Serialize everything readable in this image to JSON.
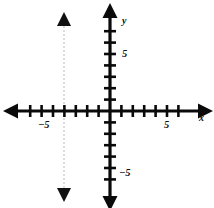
{
  "figure": {
    "kind": "coordinate-plane",
    "width": 214,
    "height": 208,
    "background_color": "#ffffff"
  },
  "axes": {
    "x": {
      "label": "x",
      "color": "#0a0a0a",
      "origin_px": 110,
      "axis_y_px": 111,
      "unit_px": 11.4,
      "line_start_px": 18,
      "line_end_px": 198,
      "tick_half_length_px": 6,
      "tick_values": [
        -7,
        -6,
        -5,
        -4,
        -3,
        -2,
        -1,
        1,
        2,
        3,
        4,
        5,
        6
      ],
      "labeled_ticks": [
        {
          "value": -5,
          "text": "−5"
        },
        {
          "value": 5,
          "text": "5"
        }
      ]
    },
    "y": {
      "label": "y",
      "color": "#0a0a0a",
      "origin_px": 111,
      "axis_x_px": 110,
      "unit_px": 11.4,
      "line_start_px": 18,
      "line_end_px": 196,
      "tick_half_length_px": 6,
      "tick_values": [
        -7,
        -6,
        -5,
        -4,
        -3,
        -2,
        -1,
        1,
        2,
        3,
        4,
        5,
        6,
        7
      ],
      "labeled_ticks": [
        {
          "value": 5,
          "text": "5"
        },
        {
          "value": -5,
          "text": "−5"
        }
      ]
    }
  },
  "graph": {
    "type": "vertical-line",
    "equation_value": -4,
    "x_px": 64,
    "stroke_color": "#b9b9b9",
    "stroke_width": 1,
    "dash_pattern": "2 2",
    "top_px": 26,
    "bottom_px": 188,
    "arrow_color": "#111111",
    "arrow_half_width_px": 7,
    "arrow_length_px": 14
  },
  "icons": {
    "x_axis_arrow": "arrow-right-icon",
    "x_axis_arrow_left": "arrow-left-icon",
    "y_axis_arrow_up": "arrow-up-icon",
    "y_axis_arrow_down": "arrow-down-icon",
    "graph_arrow_up": "arrow-up-icon",
    "graph_arrow_down": "arrow-down-icon"
  }
}
